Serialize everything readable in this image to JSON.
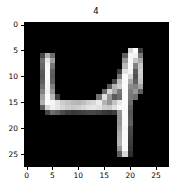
{
  "figure": {
    "background_color": "#ffffff",
    "plot_background_color": "#000000",
    "colormap": "gray"
  },
  "chart_data": {
    "type": "heatmap",
    "title": "4",
    "xlabel": "",
    "ylabel": "",
    "grid": false,
    "legend": null,
    "xlim": [
      -0.5,
      27.5
    ],
    "ylim": [
      27.5,
      -0.5
    ],
    "xticks": [
      0,
      5,
      10,
      15,
      20,
      25
    ],
    "xtick_labels": [
      "0",
      "5",
      "10",
      "15",
      "20",
      "25"
    ],
    "yticks": [
      0,
      5,
      10,
      15,
      20,
      25
    ],
    "ytick_labels": [
      "0",
      "5",
      "10",
      "15",
      "20",
      "25"
    ],
    "width": 28,
    "height": 28,
    "value_range": [
      0,
      255
    ],
    "values": [
      [
        0,
        0,
        0,
        0,
        0,
        0,
        0,
        0,
        0,
        0,
        0,
        0,
        0,
        0,
        0,
        0,
        0,
        0,
        0,
        0,
        0,
        0,
        0,
        0,
        0,
        0,
        0,
        0
      ],
      [
        0,
        0,
        0,
        0,
        0,
        0,
        0,
        0,
        0,
        0,
        0,
        0,
        0,
        0,
        0,
        0,
        0,
        0,
        0,
        0,
        0,
        0,
        0,
        0,
        0,
        0,
        0,
        0
      ],
      [
        0,
        0,
        0,
        0,
        0,
        0,
        0,
        0,
        0,
        0,
        0,
        0,
        0,
        0,
        0,
        0,
        0,
        0,
        0,
        0,
        0,
        0,
        0,
        0,
        0,
        0,
        0,
        0
      ],
      [
        0,
        0,
        0,
        0,
        0,
        0,
        0,
        0,
        0,
        0,
        0,
        0,
        0,
        0,
        0,
        0,
        0,
        0,
        0,
        0,
        0,
        0,
        0,
        0,
        0,
        0,
        0,
        0
      ],
      [
        0,
        0,
        0,
        0,
        0,
        0,
        0,
        0,
        0,
        0,
        0,
        0,
        0,
        0,
        0,
        0,
        0,
        0,
        0,
        0,
        0,
        0,
        0,
        0,
        0,
        0,
        0,
        0
      ],
      [
        0,
        0,
        0,
        0,
        0,
        0,
        0,
        0,
        0,
        0,
        0,
        0,
        0,
        0,
        0,
        0,
        0,
        0,
        0,
        0,
        215,
        255,
        60,
        0,
        0,
        0,
        0,
        0
      ],
      [
        0,
        0,
        0,
        70,
        175,
        110,
        0,
        0,
        0,
        0,
        0,
        0,
        0,
        0,
        0,
        0,
        0,
        0,
        0,
        95,
        245,
        240,
        120,
        0,
        0,
        0,
        0,
        0
      ],
      [
        0,
        0,
        0,
        110,
        230,
        160,
        0,
        0,
        0,
        0,
        0,
        0,
        0,
        0,
        0,
        0,
        0,
        0,
        0,
        150,
        250,
        200,
        170,
        0,
        0,
        0,
        0,
        0
      ],
      [
        0,
        0,
        0,
        100,
        245,
        120,
        0,
        0,
        0,
        0,
        0,
        0,
        0,
        0,
        0,
        0,
        0,
        0,
        0,
        185,
        250,
        130,
        200,
        0,
        0,
        0,
        0,
        0
      ],
      [
        0,
        0,
        0,
        90,
        250,
        95,
        0,
        0,
        0,
        0,
        0,
        0,
        0,
        0,
        0,
        0,
        0,
        0,
        60,
        225,
        245,
        90,
        210,
        0,
        0,
        0,
        0,
        0
      ],
      [
        0,
        0,
        0,
        85,
        250,
        90,
        0,
        0,
        0,
        0,
        0,
        0,
        0,
        0,
        0,
        0,
        0,
        0,
        120,
        250,
        215,
        80,
        205,
        0,
        0,
        0,
        0,
        0
      ],
      [
        0,
        0,
        0,
        95,
        248,
        100,
        0,
        0,
        0,
        0,
        0,
        0,
        0,
        0,
        0,
        0,
        0,
        70,
        190,
        250,
        170,
        95,
        195,
        0,
        0,
        0,
        0,
        0
      ],
      [
        0,
        0,
        0,
        110,
        245,
        130,
        0,
        0,
        0,
        0,
        0,
        0,
        0,
        0,
        0,
        0,
        90,
        180,
        205,
        250,
        140,
        130,
        165,
        0,
        0,
        0,
        0,
        0
      ],
      [
        0,
        0,
        0,
        130,
        240,
        150,
        0,
        0,
        0,
        0,
        0,
        0,
        0,
        0,
        0,
        105,
        215,
        170,
        120,
        250,
        125,
        150,
        95,
        0,
        0,
        0,
        0,
        0
      ],
      [
        0,
        0,
        0,
        160,
        250,
        185,
        60,
        0,
        0,
        0,
        0,
        0,
        0,
        0,
        115,
        225,
        150,
        90,
        110,
        252,
        120,
        110,
        0,
        0,
        0,
        0,
        0,
        0
      ],
      [
        0,
        0,
        0,
        175,
        252,
        245,
        225,
        205,
        195,
        185,
        180,
        190,
        205,
        215,
        235,
        180,
        150,
        195,
        230,
        250,
        110,
        0,
        0,
        0,
        0,
        0,
        0,
        0
      ],
      [
        0,
        0,
        0,
        95,
        215,
        240,
        230,
        215,
        205,
        200,
        205,
        215,
        225,
        230,
        225,
        205,
        200,
        225,
        245,
        248,
        95,
        0,
        0,
        0,
        0,
        0,
        0,
        0
      ],
      [
        0,
        0,
        0,
        0,
        70,
        110,
        95,
        75,
        60,
        55,
        60,
        65,
        70,
        70,
        65,
        55,
        50,
        60,
        150,
        250,
        85,
        0,
        0,
        0,
        0,
        0,
        0,
        0
      ],
      [
        0,
        0,
        0,
        0,
        0,
        0,
        0,
        0,
        0,
        0,
        0,
        0,
        0,
        0,
        0,
        0,
        0,
        0,
        145,
        250,
        90,
        0,
        0,
        0,
        0,
        0,
        0,
        0
      ],
      [
        0,
        0,
        0,
        0,
        0,
        0,
        0,
        0,
        0,
        0,
        0,
        0,
        0,
        0,
        0,
        0,
        0,
        0,
        150,
        250,
        95,
        0,
        0,
        0,
        0,
        0,
        0,
        0
      ],
      [
        0,
        0,
        0,
        0,
        0,
        0,
        0,
        0,
        0,
        0,
        0,
        0,
        0,
        0,
        0,
        0,
        0,
        0,
        160,
        248,
        75,
        0,
        0,
        0,
        0,
        0,
        0,
        0
      ],
      [
        0,
        0,
        0,
        0,
        0,
        0,
        0,
        0,
        0,
        0,
        0,
        0,
        0,
        0,
        0,
        0,
        0,
        0,
        170,
        250,
        70,
        0,
        0,
        0,
        0,
        0,
        0,
        0
      ],
      [
        0,
        0,
        0,
        0,
        0,
        0,
        0,
        0,
        0,
        0,
        0,
        0,
        0,
        0,
        0,
        0,
        0,
        0,
        175,
        250,
        65,
        0,
        0,
        0,
        0,
        0,
        0,
        0
      ],
      [
        0,
        0,
        0,
        0,
        0,
        0,
        0,
        0,
        0,
        0,
        0,
        0,
        0,
        0,
        0,
        0,
        0,
        0,
        180,
        250,
        60,
        0,
        0,
        0,
        0,
        0,
        0,
        0
      ],
      [
        0,
        0,
        0,
        0,
        0,
        0,
        0,
        0,
        0,
        0,
        0,
        0,
        0,
        0,
        0,
        0,
        0,
        0,
        150,
        250,
        55,
        0,
        0,
        0,
        0,
        0,
        0,
        0
      ],
      [
        0,
        0,
        0,
        0,
        0,
        0,
        0,
        0,
        0,
        0,
        0,
        0,
        0,
        0,
        0,
        0,
        0,
        0,
        95,
        215,
        45,
        0,
        0,
        0,
        0,
        0,
        0,
        0
      ],
      [
        0,
        0,
        0,
        0,
        0,
        0,
        0,
        0,
        0,
        0,
        0,
        0,
        0,
        0,
        0,
        0,
        0,
        0,
        0,
        0,
        0,
        0,
        0,
        0,
        0,
        0,
        0,
        0
      ],
      [
        0,
        0,
        0,
        0,
        0,
        0,
        0,
        0,
        0,
        0,
        0,
        0,
        0,
        0,
        0,
        0,
        0,
        0,
        0,
        0,
        0,
        0,
        0,
        0,
        0,
        0,
        0,
        0
      ]
    ]
  }
}
